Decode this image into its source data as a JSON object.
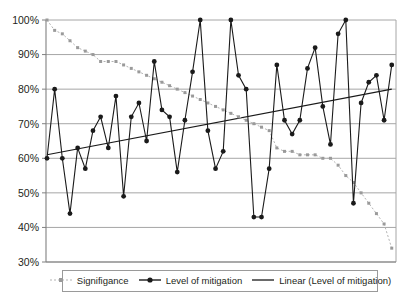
{
  "chart_data": {
    "type": "line",
    "title": "",
    "subtitle": "",
    "xlabel": "",
    "ylabel": "",
    "ylim": [
      30,
      100
    ],
    "ytick_labels": [
      "100%",
      "90%",
      "80%",
      "70%",
      "60%",
      "50%",
      "40%",
      "30%"
    ],
    "ytick_values": [
      100,
      90,
      80,
      70,
      60,
      50,
      40,
      30
    ],
    "ytick_suffix": "%",
    "grid": "horizontal",
    "xtick_labels": [],
    "legend_position": "bottom",
    "n_points": 46,
    "series": [
      {
        "name": "Signifigance",
        "marker": "small-square",
        "line_style": "dotted",
        "color": "#b3b3b3",
        "values": [
          100,
          97,
          96,
          94,
          92,
          91,
          90,
          88,
          88,
          88,
          87,
          86,
          85,
          84,
          83,
          82,
          81,
          80,
          79,
          78,
          77,
          76,
          75,
          74,
          73,
          72,
          71,
          70,
          69,
          68,
          63,
          62,
          62,
          61,
          61,
          61,
          60,
          60,
          58,
          55,
          53,
          50,
          47,
          44,
          41,
          34
        ]
      },
      {
        "name": "Level of mitigation",
        "marker": "filled-circle",
        "line_style": "solid",
        "color": "#1a1a1a",
        "values": [
          60,
          80,
          60,
          44,
          63,
          57,
          68,
          72,
          63,
          78,
          49,
          72,
          76,
          65,
          88,
          74,
          72,
          56,
          71,
          85,
          100,
          68,
          57,
          62,
          100,
          84,
          80,
          43,
          43,
          57,
          87,
          71,
          67,
          71,
          86,
          92,
          75,
          64,
          96,
          100,
          47,
          76,
          82,
          84,
          71,
          87
        ]
      },
      {
        "name": "Linear (Level of mitigation)",
        "marker": "none",
        "line_style": "solid-thin",
        "color": "#1a1a1a",
        "trend_start": 61,
        "trend_end": 80,
        "values": []
      }
    ]
  },
  "legend": {
    "items": [
      {
        "label": "Signifigance",
        "swatch": "dotted-gray-square-marker"
      },
      {
        "label": "Level of mitigation",
        "swatch": "solid-black-circle-marker"
      },
      {
        "label": "Linear (Level of mitigation)",
        "swatch": "solid-black-line"
      }
    ]
  },
  "colors": {
    "significance": "#b3b3b3",
    "mitigation": "#1a1a1a",
    "trend": "#1a1a1a",
    "grid": "#a6a6a6",
    "axis": "#808080",
    "background": "#ffffff"
  }
}
